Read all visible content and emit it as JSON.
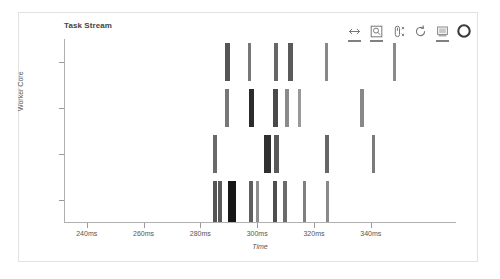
{
  "figure": {
    "title": "Task Stream",
    "background": "#ffffff",
    "border_color": "#e2e2e2",
    "axis_color": "#b0b0b0"
  },
  "toolbar": {
    "tools": [
      {
        "name": "pan-tool",
        "label": "Pan",
        "icon": "pan-icon",
        "active": true
      },
      {
        "name": "box-zoom-tool",
        "label": "Box Zoom",
        "icon": "box-zoom-icon",
        "active": true
      },
      {
        "name": "wheel-zoom-tool",
        "label": "Wheel Zoom",
        "icon": "wheel-zoom-icon",
        "active": false
      },
      {
        "name": "reset-tool",
        "label": "Reset",
        "icon": "reset-icon",
        "active": false
      },
      {
        "name": "save-tool",
        "label": "Save",
        "icon": "save-icon",
        "active": true
      }
    ],
    "logo_label": "Bokeh"
  },
  "chart_data": {
    "type": "bar",
    "title": "Task Stream",
    "xlabel": "Time",
    "ylabel": "Worker Core",
    "xlim": [
      232,
      370
    ],
    "ylim": [
      0,
      4
    ],
    "grid": false,
    "legend": null,
    "x_ticks": [
      {
        "value": 240,
        "label": "240ms"
      },
      {
        "value": 260,
        "label": "260ms"
      },
      {
        "value": 280,
        "label": "280ms"
      },
      {
        "value": 300,
        "label": "300ms"
      },
      {
        "value": 320,
        "label": "320ms"
      },
      {
        "value": 340,
        "label": "340ms"
      }
    ],
    "y_ticks": [
      {
        "value": 3.5,
        "label": ""
      },
      {
        "value": 2.5,
        "label": ""
      },
      {
        "value": 1.5,
        "label": ""
      },
      {
        "value": 0.5,
        "label": ""
      }
    ],
    "rows": [
      {
        "core": 4,
        "lane_top": 4,
        "lane_height": 38,
        "tasks": [
          {
            "start": 288.5,
            "duration": 1.6,
            "color": "#555555"
          },
          {
            "start": 296.3,
            "duration": 1.3,
            "color": "#777777"
          },
          {
            "start": 305.6,
            "duration": 1.4,
            "color": "#666666"
          },
          {
            "start": 310.6,
            "duration": 1.6,
            "color": "#5a5a5a"
          },
          {
            "start": 323.5,
            "duration": 1.2,
            "color": "#888888"
          },
          {
            "start": 347.3,
            "duration": 1.2,
            "color": "#8a8a8a"
          }
        ]
      },
      {
        "core": 3,
        "lane_top": 50,
        "lane_height": 38,
        "tasks": [
          {
            "start": 288.5,
            "duration": 1.3,
            "color": "#777777"
          },
          {
            "start": 296.6,
            "duration": 2.1,
            "color": "#2b2b2b"
          },
          {
            "start": 305.3,
            "duration": 1.7,
            "color": "#4a4a4a"
          },
          {
            "start": 309.6,
            "duration": 1.3,
            "color": "#8a8a8a"
          },
          {
            "start": 313.9,
            "duration": 1.2,
            "color": "#999999"
          },
          {
            "start": 336.0,
            "duration": 1.2,
            "color": "#888888"
          }
        ]
      },
      {
        "core": 2,
        "lane_top": 96,
        "lane_height": 38,
        "tasks": [
          {
            "start": 284.0,
            "duration": 1.4,
            "color": "#6a6a6a"
          },
          {
            "start": 302.0,
            "duration": 2.4,
            "color": "#2f2f2f"
          },
          {
            "start": 305.6,
            "duration": 1.6,
            "color": "#5a5a5a"
          },
          {
            "start": 323.4,
            "duration": 1.5,
            "color": "#666666"
          },
          {
            "start": 340.0,
            "duration": 1.3,
            "color": "#7a7a7a"
          }
        ]
      },
      {
        "core": 1,
        "lane_top": 142,
        "lane_height": 42,
        "tasks": [
          {
            "start": 284.0,
            "duration": 1.4,
            "color": "#555555"
          },
          {
            "start": 285.9,
            "duration": 1.3,
            "color": "#5a5a5a"
          },
          {
            "start": 289.4,
            "duration": 2.8,
            "color": "#161616"
          },
          {
            "start": 296.7,
            "duration": 1.4,
            "color": "#5f5f5f"
          },
          {
            "start": 299.2,
            "duration": 1.2,
            "color": "#8f8f8f"
          },
          {
            "start": 305.2,
            "duration": 1.5,
            "color": "#4f4f4f"
          },
          {
            "start": 308.7,
            "duration": 1.3,
            "color": "#6b6b6b"
          },
          {
            "start": 315.8,
            "duration": 1.2,
            "color": "#7f7f7f"
          },
          {
            "start": 323.9,
            "duration": 1.2,
            "color": "#8a8a8a"
          }
        ]
      }
    ]
  }
}
